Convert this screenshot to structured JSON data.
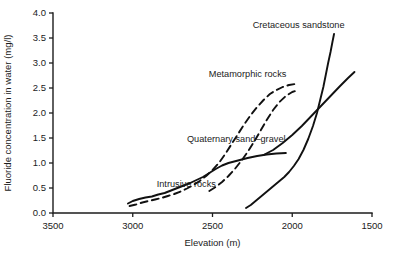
{
  "chart_data": {
    "type": "line",
    "title": "",
    "xlabel": "Elevation (m)",
    "ylabel": "Fluoride concentration in water (mg/l)",
    "xlim": [
      3500,
      1500
    ],
    "ylim": [
      0.0,
      4.0
    ],
    "x_ticks": [
      3500,
      3000,
      2500,
      2000,
      1500
    ],
    "x_tick_labels": [
      "3500",
      "3000",
      "2500",
      "2000",
      "1500"
    ],
    "y_ticks": [
      0.0,
      0.5,
      1.0,
      1.5,
      2.0,
      2.5,
      3.0,
      3.5,
      4.0
    ],
    "y_tick_labels": [
      "0.0",
      "0.5",
      "1.0",
      "1.5",
      "2.0",
      "2.5",
      "3.0",
      "3.5",
      "4.0"
    ],
    "x_axis_inverted": true,
    "grid": false,
    "legend": "inline-annotations",
    "series": [
      {
        "name": "Intrusive rocks",
        "style": "solid",
        "label_x": 2850,
        "label_y": 0.52,
        "points": [
          [
            3030,
            0.19
          ],
          [
            3000,
            0.24
          ],
          [
            2960,
            0.28
          ],
          [
            2920,
            0.31
          ],
          [
            2880,
            0.33
          ],
          [
            2840,
            0.37
          ],
          [
            2800,
            0.4
          ],
          [
            2760,
            0.45
          ],
          [
            2720,
            0.5
          ],
          [
            2680,
            0.55
          ],
          [
            2640,
            0.6
          ],
          [
            2600,
            0.66
          ],
          [
            2560,
            0.72
          ],
          [
            2520,
            0.8
          ],
          [
            2480,
            0.88
          ],
          [
            2440,
            0.95
          ],
          [
            2400,
            1.0
          ],
          [
            2340,
            1.05
          ],
          [
            2280,
            1.1
          ],
          [
            2220,
            1.14
          ],
          [
            2160,
            1.17
          ],
          [
            2100,
            1.19
          ],
          [
            2040,
            1.2
          ]
        ]
      },
      {
        "name": "Quaternary sand-gravel",
        "style": "dashed",
        "label_x": 2660,
        "label_y": 1.42,
        "points": [
          [
            3020,
            0.14
          ],
          [
            2980,
            0.17
          ],
          [
            2940,
            0.21
          ],
          [
            2900,
            0.24
          ],
          [
            2860,
            0.27
          ],
          [
            2820,
            0.3
          ],
          [
            2780,
            0.34
          ],
          [
            2740,
            0.38
          ],
          [
            2700,
            0.43
          ],
          [
            2660,
            0.49
          ],
          [
            2620,
            0.56
          ],
          [
            2580,
            0.64
          ],
          [
            2540,
            0.74
          ],
          [
            2500,
            0.86
          ],
          [
            2460,
            1.0
          ],
          [
            2420,
            1.18
          ],
          [
            2380,
            1.38
          ],
          [
            2340,
            1.58
          ],
          [
            2300,
            1.78
          ],
          [
            2260,
            1.96
          ],
          [
            2220,
            2.12
          ],
          [
            2180,
            2.26
          ],
          [
            2140,
            2.38
          ],
          [
            2100,
            2.46
          ],
          [
            2060,
            2.52
          ],
          [
            2020,
            2.56
          ],
          [
            1980,
            2.58
          ]
        ]
      },
      {
        "name": "Metamorphic rocks",
        "style": "dashed",
        "label_x": 2280,
        "label_y": 2.72,
        "points": [
          [
            2520,
            0.44
          ],
          [
            2480,
            0.52
          ],
          [
            2440,
            0.62
          ],
          [
            2400,
            0.74
          ],
          [
            2360,
            0.88
          ],
          [
            2320,
            1.04
          ],
          [
            2280,
            1.22
          ],
          [
            2240,
            1.42
          ],
          [
            2200,
            1.64
          ],
          [
            2160,
            1.86
          ],
          [
            2120,
            2.06
          ],
          [
            2080,
            2.22
          ],
          [
            2040,
            2.34
          ],
          [
            2000,
            2.42
          ],
          [
            1960,
            2.46
          ]
        ]
      },
      {
        "name": "Metamorphic rocks upper",
        "style": "solid",
        "label_x": null,
        "label_y": null,
        "points": [
          [
            2180,
            1.16
          ],
          [
            2120,
            1.26
          ],
          [
            2060,
            1.4
          ],
          [
            2000,
            1.56
          ],
          [
            1940,
            1.74
          ],
          [
            1880,
            1.94
          ],
          [
            1820,
            2.14
          ],
          [
            1760,
            2.34
          ],
          [
            1700,
            2.54
          ],
          [
            1650,
            2.7
          ],
          [
            1610,
            2.82
          ]
        ]
      },
      {
        "name": "Cretaceous sandstone",
        "style": "solid",
        "label_x": 1960,
        "label_y": 3.7,
        "points": [
          [
            2290,
            0.1
          ],
          [
            2260,
            0.16
          ],
          [
            2230,
            0.24
          ],
          [
            2200,
            0.32
          ],
          [
            2170,
            0.4
          ],
          [
            2140,
            0.48
          ],
          [
            2110,
            0.56
          ],
          [
            2080,
            0.64
          ],
          [
            2050,
            0.72
          ],
          [
            2020,
            0.82
          ],
          [
            1990,
            0.94
          ],
          [
            1960,
            1.08
          ],
          [
            1930,
            1.26
          ],
          [
            1900,
            1.48
          ],
          [
            1870,
            1.74
          ],
          [
            1845,
            2.0
          ],
          [
            1825,
            2.26
          ],
          [
            1805,
            2.52
          ],
          [
            1790,
            2.76
          ],
          [
            1775,
            3.0
          ],
          [
            1760,
            3.22
          ],
          [
            1748,
            3.42
          ],
          [
            1738,
            3.58
          ]
        ]
      }
    ]
  },
  "caption": ""
}
